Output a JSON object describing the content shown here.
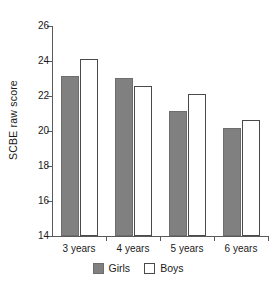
{
  "chart_data": {
    "type": "bar",
    "title": "",
    "xlabel": "",
    "ylabel": "SCBE raw score",
    "categories": [
      "3 years",
      "4 years",
      "5 years",
      "6 years"
    ],
    "series": [
      {
        "name": "Girls",
        "color": "#808080",
        "values": [
          23.15,
          23.05,
          21.15,
          20.2
        ]
      },
      {
        "name": "Boys",
        "color": "#ffffff",
        "values": [
          24.1,
          22.55,
          22.1,
          20.65
        ]
      }
    ],
    "ylim": [
      14,
      26
    ],
    "yticks": [
      14,
      16,
      18,
      20,
      22,
      24,
      26
    ],
    "ytick_labels": [
      "14",
      "16",
      "18",
      "20",
      "22",
      "24",
      "26"
    ],
    "grid": false,
    "legend_position": "bottom-center",
    "legend_entries": [
      "Girls",
      "Boys"
    ]
  }
}
